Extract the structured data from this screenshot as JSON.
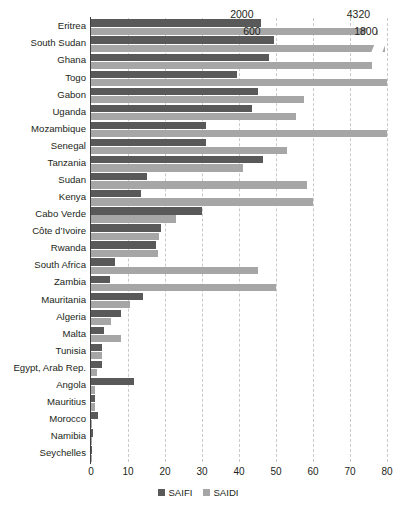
{
  "chart_data": {
    "type": "bar",
    "orientation": "horizontal",
    "title": "",
    "subtitle": "",
    "xlabel": "",
    "ylabel": "",
    "xlim": [
      0,
      80
    ],
    "xticks": [
      0,
      10,
      20,
      30,
      40,
      50,
      60,
      70,
      80
    ],
    "xtick_labels": [
      "0",
      "10",
      "20",
      "30",
      "40",
      "50",
      "60",
      "70",
      "80"
    ],
    "grid": true,
    "grid_axis": "x",
    "legend": [
      "SAIFI",
      "SAIDI"
    ],
    "legend_position": "bottom-center",
    "colors": {
      "saifi": "#595959",
      "saidi": "#a6a6a6"
    },
    "categories": [
      "Eritrea",
      "South Sudan",
      "Ghana",
      "Togo",
      "Gabon",
      "Uganda",
      "Mozambique",
      "Senegal",
      "Tanzania",
      "Sudan",
      "Kenya",
      "Cabo Verde",
      "Côte d’Ivoire",
      "Rwanda",
      "South Africa",
      "Zambia",
      "Mauritania",
      "Algeria",
      "Malta",
      "Tunisia",
      "Egypt, Arab Rep.",
      "Angola",
      "Mauritius",
      "Morocco",
      "Namibia",
      "Seychelles"
    ],
    "series": [
      {
        "name": "SAIFI",
        "color": "#595959",
        "values": [
          46.0,
          49.5,
          48.0,
          39.5,
          45.0,
          43.5,
          31.0,
          31.0,
          46.5,
          15.0,
          13.5,
          30.0,
          19.0,
          17.5,
          6.5,
          5.0,
          14.0,
          8.0,
          3.5,
          3.0,
          3.0,
          11.5,
          1.0,
          2.0,
          0.5,
          0.3
        ]
      },
      {
        "name": "SAIDI",
        "color": "#a6a6a6",
        "values": [
          77.5,
          79.5,
          76.0,
          80.0,
          57.5,
          55.5,
          80.0,
          53.0,
          41.0,
          58.5,
          60.0,
          23.0,
          18.5,
          18.0,
          45.0,
          50.0,
          10.5,
          5.5,
          8.0,
          3.0,
          1.5,
          1.0,
          1.0,
          0.3,
          0.3,
          0.2
        ]
      }
    ],
    "annotations": [
      {
        "text": "2000",
        "series": "SAIFI",
        "category": "Eritrea"
      },
      {
        "text": "4320",
        "series": "SAIDI",
        "category": "Eritrea"
      },
      {
        "text": "600",
        "series": "SAIFI",
        "category": "South Sudan"
      },
      {
        "text": "1800",
        "series": "SAIDI",
        "category": "South Sudan"
      }
    ],
    "truncated_bars": [
      {
        "category": "Eritrea",
        "series": "SAIDI",
        "actual_value": 4320
      },
      {
        "category": "South Sudan",
        "series": "SAIDI",
        "actual_value": 1800
      }
    ]
  }
}
